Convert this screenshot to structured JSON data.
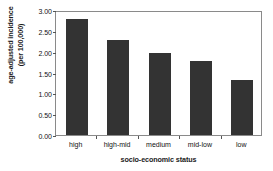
{
  "chart_data": {
    "type": "bar",
    "title": "",
    "categories": [
      "high",
      "high-mid",
      "medium",
      "mid-low",
      "low"
    ],
    "values": [
      2.78,
      2.28,
      1.96,
      1.78,
      1.32
    ],
    "series": [
      {
        "name": "age-adjusted incidence (per 100,000)",
        "values": [
          2.78,
          2.28,
          1.96,
          1.78,
          1.32
        ]
      }
    ],
    "xlabel": "socio-economic status",
    "ylabel": "age-adjusted incidence (per 100,000)",
    "ylabel_line1": "age-adjusted incidence",
    "ylabel_line2": "(per 100,000)",
    "ylim": [
      0.0,
      3.0
    ],
    "ytick_values": [
      0.0,
      0.5,
      1.0,
      1.5,
      2.0,
      2.5,
      3.0
    ],
    "ytick_labels": [
      "0.00",
      "0.50",
      "1.00",
      "1.50",
      "2.00",
      "2.50",
      "3.00"
    ],
    "grid": false,
    "legend": false,
    "legend_position": "none",
    "bar_color": "#333333",
    "frame_color": "#8a8a8a",
    "background_color": "#ffffff"
  }
}
